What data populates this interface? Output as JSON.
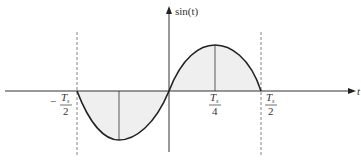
{
  "diagram": {
    "type": "sine-wave-plot",
    "y_axis_label": "sin(t)",
    "x_axis_label": "t",
    "tick_labels": [
      {
        "id": "neg-half",
        "sign": "−",
        "numerator": "T",
        "subscript": "s",
        "denominator": "2"
      },
      {
        "id": "quarter",
        "sign": "",
        "numerator": "T",
        "subscript": "s",
        "denominator": "4"
      },
      {
        "id": "half",
        "sign": "",
        "numerator": "T",
        "subscript": "s",
        "denominator": "2"
      }
    ],
    "colors": {
      "curve": "#222222",
      "axis": "#333333",
      "fill": "#efefef",
      "dashed": "#666666"
    }
  }
}
